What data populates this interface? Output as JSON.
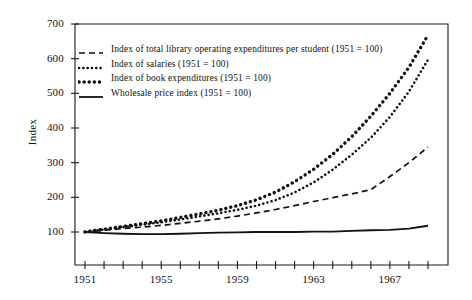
{
  "axes": {
    "ylabel": "Index",
    "yticks": [
      "100",
      "200",
      "300",
      "400",
      "500",
      "600",
      "700"
    ],
    "xticks_labeled": [
      "1951",
      "1955",
      "1959",
      "1963",
      "1967"
    ]
  },
  "legend": {
    "items": [
      {
        "label": "Index of total library operating expenditures per student (1951 = 100)",
        "marker": "dashed-line-marker"
      },
      {
        "label": "Index of salaries (1951 = 100)",
        "marker": "fine-dotted-line-marker"
      },
      {
        "label": "Index of book expenditures (1951 = 100)",
        "marker": "coarse-dotted-line-marker"
      },
      {
        "label": "Wholesale price index (1951 = 100)",
        "marker": "solid-line-marker"
      }
    ]
  },
  "chart_data": {
    "type": "line",
    "title": "",
    "xlabel": "",
    "ylabel": "Index",
    "xlim": [
      1951,
      1969
    ],
    "ylim": [
      0,
      700
    ],
    "yticks": [
      100,
      200,
      300,
      400,
      500,
      600,
      700
    ],
    "xticks": [
      1951,
      1952,
      1953,
      1954,
      1955,
      1956,
      1957,
      1958,
      1959,
      1960,
      1961,
      1962,
      1963,
      1964,
      1965,
      1966,
      1967,
      1968,
      1969
    ],
    "xtick_labels_shown": [
      1951,
      1955,
      1959,
      1963,
      1967
    ],
    "grid": false,
    "legend_position": "upper-left-inside",
    "x": [
      1951,
      1952,
      1953,
      1954,
      1955,
      1956,
      1957,
      1958,
      1959,
      1960,
      1961,
      1962,
      1963,
      1964,
      1965,
      1966,
      1967,
      1968,
      1969
    ],
    "series": [
      {
        "name": "Index of book expenditures (1951 = 100)",
        "style": "coarse-dotted",
        "values": [
          100,
          108,
          116,
          124,
          132,
          142,
          152,
          163,
          176,
          193,
          215,
          245,
          281,
          324,
          375,
          434,
          500,
          575,
          668
        ]
      },
      {
        "name": "Index of salaries (1951 = 100)",
        "style": "fine-dotted",
        "values": [
          100,
          107,
          114,
          121,
          128,
          136,
          145,
          154,
          164,
          176,
          192,
          214,
          243,
          280,
          323,
          372,
          432,
          505,
          597
        ]
      },
      {
        "name": "Index of total library operating expenditures per student (1951 = 100)",
        "style": "dashed",
        "values": [
          100,
          105,
          110,
          114,
          119,
          125,
          131,
          138,
          146,
          155,
          165,
          176,
          188,
          199,
          210,
          222,
          260,
          300,
          345
        ]
      },
      {
        "name": "Wholesale price index (1951 = 100)",
        "style": "solid",
        "values": [
          100,
          97,
          95,
          94,
          94,
          95,
          97,
          98,
          99,
          100,
          100,
          100,
          101,
          101,
          103,
          105,
          106,
          110,
          118
        ]
      }
    ]
  }
}
